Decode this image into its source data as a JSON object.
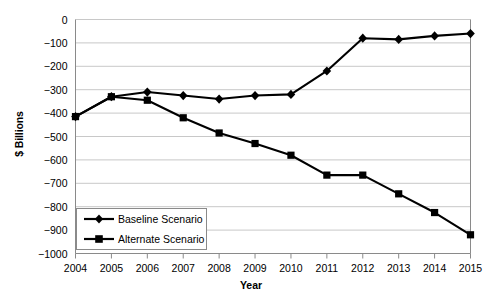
{
  "chart_data": {
    "type": "line",
    "title": "",
    "subtitle": "",
    "xlabel": "Year",
    "ylabel": "$ Billions",
    "categories": [
      "2004",
      "2005",
      "2006",
      "2007",
      "2008",
      "2009",
      "2010",
      "2011",
      "2012",
      "2013",
      "2014",
      "2015"
    ],
    "x": [
      2004,
      2005,
      2006,
      2007,
      2008,
      2009,
      2010,
      2011,
      2012,
      2013,
      2014,
      2015
    ],
    "xlim": [
      2004,
      2015
    ],
    "ylim": [
      -1000,
      0
    ],
    "ytick_labels": [
      "0",
      "−100",
      "−200",
      "−300",
      "−400",
      "−500",
      "−600",
      "−700",
      "−800",
      "−900",
      "−1000"
    ],
    "ytick_values": [
      0,
      -100,
      -200,
      -300,
      -400,
      -500,
      -600,
      -700,
      -800,
      -900,
      -1000
    ],
    "grid": true,
    "grid_axis": "y",
    "legend_position": "bottom-left",
    "series": [
      {
        "name": "Baseline Scenario",
        "marker": "diamond",
        "color": "#000000",
        "values": [
          -415,
          -330,
          -310,
          -325,
          -340,
          -325,
          -320,
          -220,
          -80,
          -85,
          -70,
          -60
        ]
      },
      {
        "name": "Alternate Scenario",
        "marker": "square",
        "color": "#000000",
        "values": [
          -415,
          -330,
          -345,
          -420,
          -485,
          -530,
          -580,
          -665,
          -665,
          -745,
          -825,
          -920
        ]
      }
    ]
  },
  "axes": {
    "y_title": "$ Billions",
    "x_title": "Year"
  },
  "legend": {
    "items": [
      {
        "label": "Baseline Scenario",
        "marker": "diamond"
      },
      {
        "label": "Alternate Scenario",
        "marker": "square"
      }
    ]
  },
  "style": {
    "line_color": "#000000",
    "grid_color": "#c8c8c8",
    "axis_color": "#8a8a8a",
    "background": "#ffffff"
  }
}
